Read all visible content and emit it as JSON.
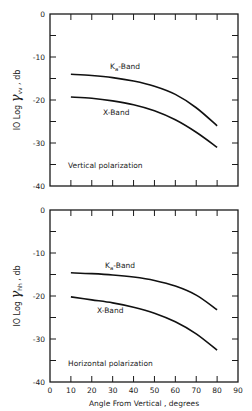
{
  "chart_data": [
    {
      "type": "line",
      "panel": "top",
      "annotation": "Vertical polarization",
      "ylabel": "10 Log γvv , db",
      "ylabel_main": "IO Log ",
      "ylabel_greek": "γ",
      "ylabel_sub": "vv",
      "ylabel_unit": " , db",
      "xlabel": "",
      "xlim": [
        0,
        90
      ],
      "ylim": [
        -40,
        0
      ],
      "yticks": [
        0,
        -10,
        -20,
        -30,
        -40
      ],
      "ytick_labels": [
        "0",
        "-10",
        "-20",
        "-30",
        "-40"
      ],
      "grid": false,
      "x": [
        10,
        20,
        30,
        40,
        50,
        60,
        70,
        80
      ],
      "series": [
        {
          "name": "Ka-Band",
          "label_main": "K",
          "label_sub": "a",
          "label_rest": "-Band",
          "values": [
            -14.0,
            -14.3,
            -14.8,
            -15.6,
            -16.8,
            -18.7,
            -21.8,
            -26.0
          ]
        },
        {
          "name": "X-Band",
          "label_main": "X-Band",
          "label_sub": "",
          "label_rest": "",
          "values": [
            -19.3,
            -19.6,
            -20.2,
            -21.1,
            -22.5,
            -24.6,
            -27.5,
            -31.0
          ]
        }
      ]
    },
    {
      "type": "line",
      "panel": "bottom",
      "annotation": "Horizontal polarization",
      "ylabel": "10 Log γhh , db",
      "ylabel_main": "IO Log ",
      "ylabel_greek": "γ",
      "ylabel_sub": "hh",
      "ylabel_unit": " , db",
      "xlabel": "Angle From Vertical , degrees",
      "xlim": [
        0,
        90
      ],
      "ylim": [
        -40,
        0
      ],
      "xticks": [
        0,
        10,
        20,
        30,
        40,
        50,
        60,
        70,
        80,
        90
      ],
      "xtick_labels": [
        "0",
        "10",
        "20",
        "30",
        "40",
        "50",
        "60",
        "70",
        "80",
        "90"
      ],
      "yticks": [
        0,
        -10,
        -20,
        -30,
        -40
      ],
      "ytick_labels": [
        "0",
        "-10",
        "-20",
        "-30",
        "-40"
      ],
      "grid": false,
      "x": [
        10,
        20,
        30,
        40,
        50,
        60,
        70,
        80
      ],
      "series": [
        {
          "name": "Ka-Band",
          "label_main": "K",
          "label_sub": "a",
          "label_rest": "-Band",
          "values": [
            -14.6,
            -14.8,
            -15.1,
            -15.6,
            -16.4,
            -17.7,
            -19.8,
            -23.2
          ]
        },
        {
          "name": "X-Band",
          "label_main": "X-Band",
          "label_sub": "",
          "label_rest": "",
          "values": [
            -20.2,
            -20.9,
            -21.6,
            -22.6,
            -24.0,
            -26.0,
            -28.8,
            -32.6
          ]
        }
      ]
    }
  ]
}
